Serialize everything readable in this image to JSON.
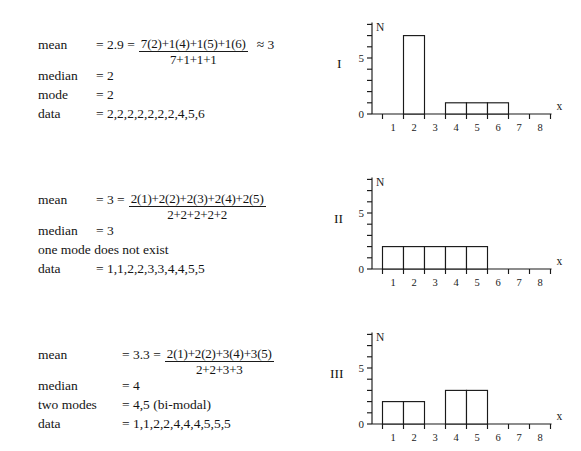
{
  "document": {
    "title": "Mean, Median and Mode with Histograms"
  },
  "blocks": [
    {
      "id": "block-1",
      "rows": {
        "mean_label": "mean",
        "mean_value": "= 2.9 =",
        "mean_numerator": "7(2)+1(4)+1(5)+1(6)",
        "mean_denominator": "7+1+1+1",
        "mean_approx": "≈ 3",
        "median_label": "median",
        "median_value": "= 2",
        "mode_label": "mode",
        "mode_value": "= 2",
        "data_label": "data",
        "data_value": "= 2,2,2,2,2,2,2,4,5,6"
      }
    },
    {
      "id": "block-2",
      "rows": {
        "mean_label": "mean",
        "mean_value": "= 3 =",
        "mean_numerator": "2(1)+2(2)+2(3)+2(4)+2(5)",
        "mean_denominator": "2+2+2+2+2",
        "mean_approx": "",
        "median_label": "median",
        "median_value": "= 3",
        "mode_label": "one mode does not exist",
        "mode_value": "",
        "data_label": "data",
        "data_value": "= 1,1,2,2,3,3,4,4,5,5"
      }
    },
    {
      "id": "block-3",
      "rows": {
        "mean_label": "mean",
        "mean_value": "= 3.3  =",
        "mean_numerator": "2(1)+2(2)+3(4)+3(5)",
        "mean_denominator": "2+2+3+3",
        "mean_approx": "",
        "median_label": "median",
        "median_value": "= 4",
        "mode_label": "two modes",
        "mode_value": "= 4,5 (bi-modal)",
        "data_label": "data",
        "data_value": "= 1,1,2,2,4,4,4,5,5,5"
      }
    }
  ],
  "charts": [
    {
      "roman": "I",
      "y_axis_label": "N",
      "x_axis_label": "x",
      "y_ticks": [
        "0",
        "5"
      ],
      "x_ticks": [
        "1",
        "2",
        "3",
        "4",
        "5",
        "6",
        "7",
        "8"
      ]
    },
    {
      "roman": "II",
      "y_axis_label": "N",
      "x_axis_label": "x",
      "y_ticks": [
        "0",
        "5"
      ],
      "x_ticks": [
        "1",
        "2",
        "3",
        "4",
        "5",
        "6",
        "7",
        "8"
      ]
    },
    {
      "roman": "III",
      "y_axis_label": "N",
      "x_axis_label": "x",
      "y_ticks": [
        "0",
        "5"
      ],
      "x_ticks": [
        "1",
        "2",
        "3",
        "4",
        "5",
        "6",
        "7",
        "8"
      ]
    }
  ],
  "chart_data": [
    {
      "type": "bar",
      "title": "I",
      "xlabel": "x",
      "ylabel": "N",
      "categories": [
        1,
        2,
        3,
        4,
        5,
        6,
        7,
        8
      ],
      "values": [
        0,
        7,
        0,
        1,
        1,
        1,
        0,
        0
      ],
      "xlim": [
        0.5,
        8.5
      ],
      "ylim": [
        0,
        8
      ],
      "ytick_labels": [
        0,
        5
      ],
      "ytick_values": [
        0,
        5
      ],
      "minor_ytick_values": [
        1,
        2,
        3,
        4,
        6,
        7,
        8
      ],
      "grid": false,
      "legend": false,
      "stroke": "#1a1a1a",
      "fill": "#ffffff"
    },
    {
      "type": "bar",
      "title": "II",
      "xlabel": "x",
      "ylabel": "N",
      "categories": [
        1,
        2,
        3,
        4,
        5,
        6,
        7,
        8
      ],
      "values": [
        2,
        2,
        2,
        2,
        2,
        0,
        0,
        0
      ],
      "xlim": [
        0.5,
        8.5
      ],
      "ylim": [
        0,
        8
      ],
      "ytick_labels": [
        0,
        5
      ],
      "ytick_values": [
        0,
        5
      ],
      "minor_ytick_values": [
        1,
        2,
        3,
        4,
        6,
        7,
        8
      ],
      "grid": false,
      "legend": false,
      "stroke": "#1a1a1a",
      "fill": "#ffffff"
    },
    {
      "type": "bar",
      "title": "III",
      "xlabel": "x",
      "ylabel": "N",
      "categories": [
        1,
        2,
        3,
        4,
        5,
        6,
        7,
        8
      ],
      "values": [
        2,
        2,
        0,
        3,
        3,
        0,
        0,
        0
      ],
      "xlim": [
        0.5,
        8.5
      ],
      "ylim": [
        0,
        8
      ],
      "ytick_labels": [
        0,
        5
      ],
      "ytick_values": [
        0,
        5
      ],
      "minor_ytick_values": [
        1,
        2,
        3,
        4,
        6,
        7,
        8
      ],
      "grid": false,
      "legend": false,
      "stroke": "#1a1a1a",
      "fill": "#ffffff"
    }
  ]
}
